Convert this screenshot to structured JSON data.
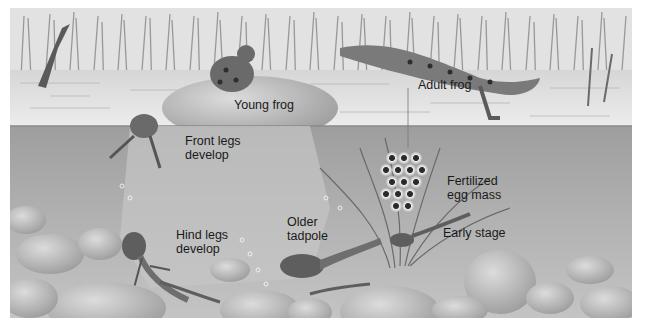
{
  "figure": {
    "colors": {
      "sky": "#e6e6e6",
      "reeds": "#9a9a9a",
      "surface_water": "#d8d8d8",
      "underwater": "#a8a8a8",
      "rock": "#bdbdbd",
      "frog": "#6e6e6e",
      "label_text": "#1a1a1a"
    },
    "labels": {
      "young_frog": "Young frog",
      "adult_frog": "Adult frog",
      "front_legs_line1": "Front legs",
      "front_legs_line2": "develop",
      "fertilized_line1": "Fertilized",
      "fertilized_line2": "egg mass",
      "early_stage": "Early stage",
      "hind_legs_line1": "Hind legs",
      "hind_legs_line2": "develop",
      "older_tadpole_line1": "Older",
      "older_tadpole_line2": "tadpole"
    },
    "stages": [
      "Fertilized egg mass",
      "Early stage",
      "Older tadpole",
      "Hind legs develop",
      "Front legs develop",
      "Young frog",
      "Adult frog"
    ]
  }
}
